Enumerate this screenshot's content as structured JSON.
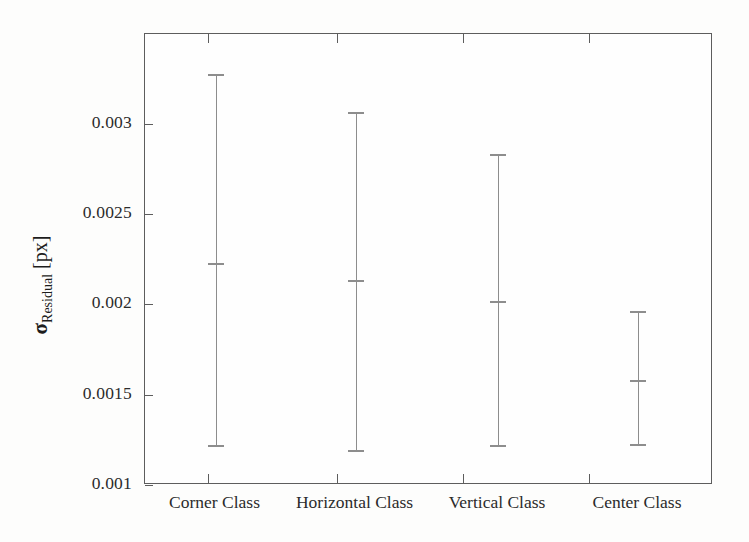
{
  "chart_data": {
    "type": "scatter",
    "title": "",
    "xlabel": "",
    "ylabel": "σResidual [px]",
    "ylabel_symbol": "σ",
    "ylabel_subscript": "Residual",
    "ylabel_unit": "[px]",
    "categories": [
      "Corner Class",
      "Horizontal Class",
      "Vertical Class",
      "Center Class"
    ],
    "ylim": [
      0.001,
      0.00335
    ],
    "yticks": [
      0.003,
      0.0025,
      0.002,
      0.0015,
      0.001
    ],
    "ytick_labels": [
      "0.003",
      "0.0025",
      "0.002",
      "0.0015",
      "0.001"
    ],
    "grid": false,
    "legend": "none",
    "series": [
      {
        "name": "Residual std dev",
        "values": [
          0.00223,
          0.002133,
          0.002017,
          0.00158
        ],
        "upper": [
          0.00327,
          0.00306,
          0.002827,
          0.001959
        ],
        "lower": [
          0.001218,
          0.001188,
          0.001216,
          0.001221
        ]
      }
    ],
    "points": [
      {
        "category": "Corner Class",
        "mean": 0.00223,
        "upper": 0.00327,
        "lower": 0.001218
      },
      {
        "category": "Horizontal Class",
        "mean": 0.002133,
        "upper": 0.00306,
        "lower": 0.001188
      },
      {
        "category": "Vertical Class",
        "mean": 0.002017,
        "upper": 0.002827,
        "lower": 0.001216
      },
      {
        "category": "Center Class",
        "mean": 0.00158,
        "upper": 0.001959,
        "lower": 0.001221
      }
    ],
    "colors": {
      "errorbar": "#8d8d8d",
      "axis": "#5d5d5d",
      "text": "#1d1d1d",
      "background": "#fdfdfc"
    }
  },
  "axis": {
    "ytick_labels": [
      "0.003",
      "0.0025",
      "0.002",
      "0.0015",
      "0.001"
    ],
    "xtick_labels": [
      "Corner Class",
      "Horizontal Class",
      "Vertical Class",
      "Center Class"
    ]
  }
}
